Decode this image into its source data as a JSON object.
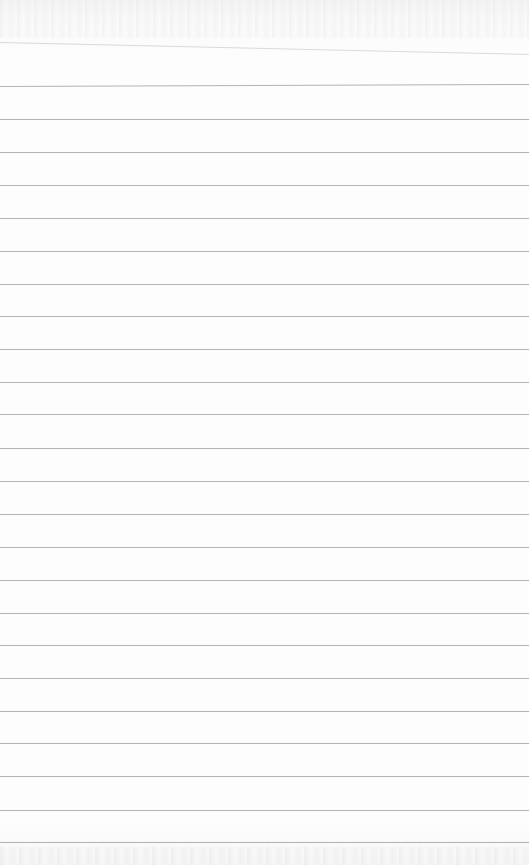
{
  "page": {
    "type": "lined-notepad-sheet",
    "background_color": "#fdfdfd",
    "rule_color": "#9a9a9a",
    "rule_spacing_px": 33,
    "top_slanted_rule": {
      "y_left": 42,
      "y_right": 54
    },
    "rules_y": [
      86,
      119,
      152,
      185,
      218,
      251,
      284,
      316,
      349,
      382,
      414,
      448,
      481,
      514,
      547,
      580,
      613,
      645,
      678,
      711,
      743,
      776,
      810,
      842
    ],
    "text": ""
  }
}
